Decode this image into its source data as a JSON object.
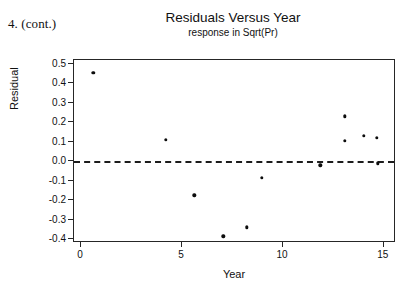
{
  "annotation": {
    "problem_label": "4. (cont.)"
  },
  "chart_data": {
    "type": "scatter",
    "title": "Residuals Versus Year",
    "subtitle": "response in Sqrt(Pr)",
    "xlabel": "Year",
    "ylabel": "Residual",
    "xlim": [
      -0.35,
      15.6
    ],
    "ylim": [
      -0.42,
      0.52
    ],
    "grid": false,
    "legend": null,
    "x_ticks": [
      0,
      5,
      10,
      15
    ],
    "x_tick_labels": [
      "0",
      "5",
      "10",
      "15"
    ],
    "y_ticks": [
      0.5,
      0.4,
      0.3,
      0.2,
      0.1,
      0.0,
      -0.1,
      -0.2,
      -0.3,
      -0.4
    ],
    "y_tick_labels": [
      "0.5",
      "0.4",
      "0.3",
      "0.2",
      "0.1",
      "0.0",
      "-0.1",
      "-0.2",
      "-0.3",
      "-0.4"
    ],
    "reference_line": {
      "orientation": "horizontal",
      "y": 0.0,
      "style": "dashed",
      "color": "#1c1c1c"
    },
    "marker": {
      "shape": "circle",
      "color": "#0d0d0d",
      "size": 3.4
    },
    "points": [
      {
        "x": 0.6,
        "y": 0.455
      },
      {
        "x": 4.2,
        "y": 0.11
      },
      {
        "x": 5.6,
        "y": -0.175
      },
      {
        "x": 7.05,
        "y": -0.385
      },
      {
        "x": 8.2,
        "y": -0.34
      },
      {
        "x": 8.95,
        "y": -0.085
      },
      {
        "x": 11.85,
        "y": -0.02
      },
      {
        "x": 13.05,
        "y": 0.23
      },
      {
        "x": 13.05,
        "y": 0.105
      },
      {
        "x": 14.0,
        "y": 0.13
      },
      {
        "x": 14.65,
        "y": 0.12
      },
      {
        "x": 14.7,
        "y": -0.01
      }
    ]
  },
  "colors": {
    "background": "#ffffff",
    "frame": "#262626",
    "text": "#111111",
    "marker": "#0d0d0d"
  }
}
